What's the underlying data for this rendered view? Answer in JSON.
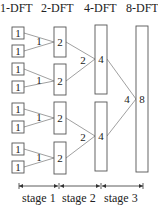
{
  "headers": [
    "1-DFT",
    "2-DFT",
    "4-DFT",
    "8-DFT"
  ],
  "box_labels": {
    "dft1": "1",
    "dft2": "2",
    "dft4": "4",
    "dft8": "8"
  },
  "edge_labels": {
    "stage1": "1",
    "stage2": "2",
    "stage3": "4"
  },
  "stages": [
    "stage 1",
    "stage 2",
    "stage 3"
  ],
  "colors": {
    "box_stroke": "#555555",
    "line": "#888888",
    "text": "#222222"
  }
}
